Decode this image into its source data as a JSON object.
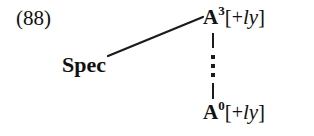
{
  "figure": {
    "example_number": "(88)",
    "background_color": "#ffffff",
    "ink_color": "#1b1b1b",
    "type": "syntax-tree"
  },
  "nodes": {
    "spec": {
      "label": "Spec"
    },
    "a3": {
      "head": "A",
      "superscript": "3",
      "bracket_open": "[",
      "feature_sign": "+",
      "feature": "ly",
      "bracket_close": "]",
      "full_label": "A3[+ly]"
    },
    "a0": {
      "head": "A",
      "superscript": "0",
      "bracket_open": "[",
      "feature_sign": "+",
      "feature": "ly",
      "bracket_close": "]",
      "full_label": "A0[+ly]"
    }
  },
  "edges": {
    "spec_to_a3": {
      "kind": "solid-branch",
      "x1": 108,
      "y1": 56,
      "x2": 203,
      "y2": 17
    },
    "a3_to_a0": {
      "kind": "dotted-dominance",
      "dot_count": 3
    }
  }
}
